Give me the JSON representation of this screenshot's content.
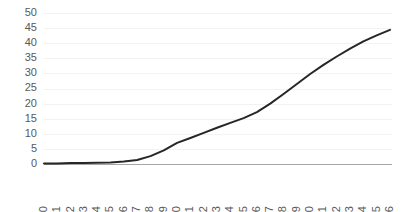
{
  "chart_data": {
    "type": "line",
    "title": "",
    "subtitle": "",
    "xlabel": "",
    "ylabel": "",
    "grid": true,
    "legend": false,
    "legend_position": "none",
    "xlim": [
      1990,
      2016
    ],
    "ylim": [
      0,
      50
    ],
    "yticks": [
      0,
      5,
      10,
      15,
      20,
      25,
      30,
      35,
      40,
      45,
      50
    ],
    "ytick_labels": [
      "0",
      "5",
      "10",
      "15",
      "20",
      "25",
      "30",
      "35",
      "40",
      "45",
      "50"
    ],
    "categories": [
      "1990",
      "1991",
      "1992",
      "1993",
      "1994",
      "1995",
      "1996",
      "1997",
      "1998",
      "1999",
      "2000",
      "2001",
      "2002",
      "2003",
      "2004",
      "2005",
      "2006",
      "2007",
      "2008",
      "2009",
      "2010",
      "2011",
      "2012",
      "2013",
      "2014",
      "2015",
      "2016"
    ],
    "xtick_labels": [
      "1990",
      "1991",
      "1992",
      "1993",
      "1994",
      "1995",
      "1996",
      "1997",
      "1998",
      "1999",
      "2000",
      "2001",
      "2002",
      "2003",
      "2004",
      "2005",
      "2006",
      "2007",
      "2008",
      "2009",
      "2010",
      "2011",
      "2012",
      "2013",
      "2014",
      "2015",
      "2016"
    ],
    "xtick_rotation": -90,
    "series": [
      {
        "name": "series-1",
        "color": "#262626",
        "line_width": 2,
        "values": [
          0.2,
          0.2,
          0.3,
          0.3,
          0.4,
          0.5,
          0.8,
          1.3,
          2.6,
          4.5,
          7.0,
          8.6,
          10.3,
          12.0,
          13.6,
          15.2,
          17.2,
          20.0,
          23.2,
          26.5,
          29.8,
          32.8,
          35.6,
          38.2,
          40.6,
          42.6,
          44.4
        ]
      }
    ],
    "colors": {
      "line": "#262626",
      "grid": "#f2f2f2",
      "axis": "#a6a6a6",
      "tick_text": "#595959",
      "background": "#ffffff"
    },
    "geometry": {
      "plot_left": 44,
      "plot_right": 390,
      "plot_top": 13,
      "plot_bottom": 164
    }
  }
}
